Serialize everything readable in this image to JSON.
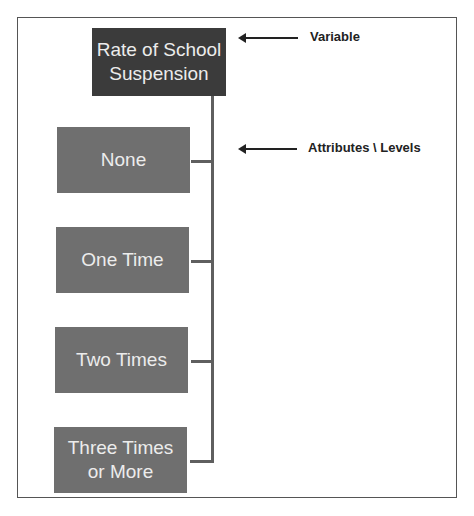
{
  "diagram": {
    "variable": {
      "label": "Rate of School Suspension",
      "line1": "Rate of School",
      "line2": "Suspension",
      "color": "#3b3b3b"
    },
    "attributes": [
      {
        "label": "None",
        "line1": "None",
        "line2": ""
      },
      {
        "label": "One Time",
        "line1": "One Time",
        "line2": ""
      },
      {
        "label": "Two Times",
        "line1": "Two Times",
        "line2": ""
      },
      {
        "label": "Three Times or More",
        "line1": "Three Times",
        "line2": "or More"
      }
    ],
    "attribute_color": "#6f6f6f",
    "annotations": {
      "variable_label": "Variable",
      "attributes_label": "Attributes \\ Levels"
    }
  }
}
